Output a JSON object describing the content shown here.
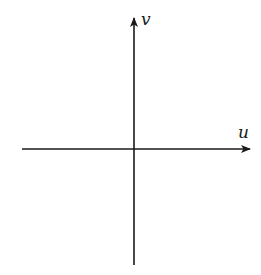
{
  "diagram": {
    "type": "coordinate-axes",
    "axes": {
      "horizontal": {
        "label": "u",
        "direction": "right"
      },
      "vertical": {
        "label": "v",
        "direction": "up"
      }
    },
    "colors": {
      "axis": "#1a1a1a",
      "background": "#ffffff"
    }
  }
}
